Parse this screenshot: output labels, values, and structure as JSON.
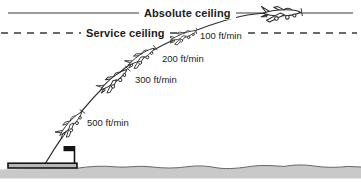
{
  "diagram": {
    "ceilings": {
      "absolute": {
        "label": "Absolute ceiling"
      },
      "service": {
        "label": "Service ceiling"
      }
    },
    "climb_rates": [
      {
        "label": "100 ft/min"
      },
      {
        "label": "200 ft/min"
      },
      {
        "label": "300 ft/min"
      },
      {
        "label": "500 ft/min"
      }
    ],
    "colors": {
      "ink": "#2e2e2e",
      "text": "#1c1c1c",
      "ground_fill": "#c9c9c9",
      "background": "#ffffff"
    }
  }
}
